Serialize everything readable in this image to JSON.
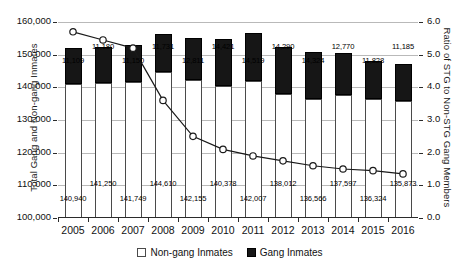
{
  "chart_data": {
    "type": "bar",
    "title": "",
    "subtitle": "",
    "xlabel": "",
    "ylabel": "Total Gang and Non-gang Inmates",
    "y2label": "Ratio of STG to Non-STG Gang Members",
    "categories": [
      "2005",
      "2006",
      "2007",
      "2008",
      "2009",
      "2010",
      "2011",
      "2012",
      "2013",
      "2014",
      "2015",
      "2016"
    ],
    "ylim": [
      100000,
      160000
    ],
    "yticks": [
      "100,000",
      "110,000",
      "120,000",
      "130,000",
      "140,000",
      "150,000",
      "160,000"
    ],
    "y2lim": [
      0.0,
      6.0
    ],
    "y2ticks": [
      "0.0",
      "1.0",
      "2.0",
      "3.0",
      "4.0",
      "5.0",
      "6.0"
    ],
    "grid": true,
    "legend_position": "bottom",
    "stacked": true,
    "series": [
      {
        "name": "Non-gang Inmates",
        "type": "bar",
        "axis": "left",
        "values": [
          140940,
          141250,
          141749,
          144610,
          142155,
          140378,
          142007,
          138012,
          136566,
          137597,
          136324,
          135873
        ],
        "labels": [
          "140,940",
          "141,250",
          "141,749",
          "144,610",
          "142,155",
          "140,378",
          "142,007",
          "138,012",
          "136,566",
          "137,597",
          "136,324",
          "135,873"
        ]
      },
      {
        "name": "Gang Inmates",
        "type": "bar",
        "axis": "left",
        "values": [
          11109,
          11180,
          11150,
          11731,
          12811,
          14421,
          14519,
          14290,
          14324,
          12770,
          11828,
          11185
        ],
        "labels": [
          "11,109",
          "11,180",
          "11,150",
          "11,731",
          "12,811",
          "14,421",
          "14,519",
          "14,290",
          "14,324",
          "12,770",
          "11,828",
          "11,185"
        ]
      },
      {
        "name": "Ratio of STG to Non-STG Gang Members",
        "type": "line",
        "axis": "right",
        "values": [
          5.7,
          5.45,
          5.2,
          3.6,
          2.5,
          2.1,
          1.9,
          1.75,
          1.6,
          1.5,
          1.45,
          1.35
        ]
      }
    ]
  },
  "legend": {
    "items": [
      {
        "label": "Non-gang Inmates",
        "swatch": "dotted-pattern-swatch"
      },
      {
        "label": "Gang Inmates",
        "swatch": "black-fill-swatch"
      }
    ]
  },
  "colors": {
    "gang_fill": "#161616",
    "nongang_fill": "#ffffff",
    "nongang_pattern": "#6d6d6d",
    "gridline": "#b9b9b9",
    "axis": "#2b2b2b",
    "text": "#111111"
  }
}
